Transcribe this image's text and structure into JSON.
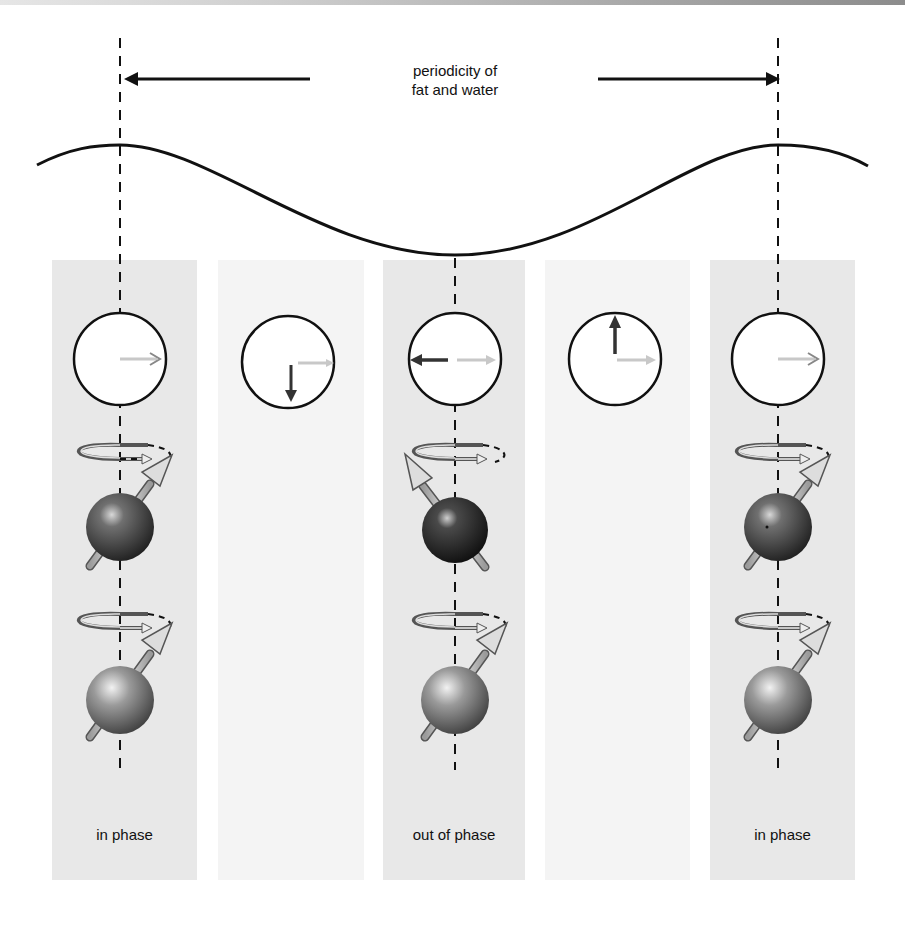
{
  "figure": {
    "title_line1": "periodicity of",
    "title_line2": "fat and water",
    "columns": [
      {
        "index": 0,
        "shade": "dark",
        "phase_label": "in phase",
        "fat_vector_direction": "right",
        "water_vector_direction": "right",
        "spins": true
      },
      {
        "index": 1,
        "shade": "light",
        "phase_label": "",
        "fat_vector_direction": "down",
        "water_vector_direction": "right",
        "spins": false
      },
      {
        "index": 2,
        "shade": "dark",
        "phase_label": "out of phase",
        "fat_vector_direction": "left",
        "water_vector_direction": "right",
        "spins": true
      },
      {
        "index": 3,
        "shade": "light",
        "phase_label": "",
        "fat_vector_direction": "up",
        "water_vector_direction": "right",
        "spins": false
      },
      {
        "index": 4,
        "shade": "dark",
        "phase_label": "in phase",
        "fat_vector_direction": "right",
        "water_vector_direction": "right",
        "spins": true
      }
    ],
    "labels": {
      "col0": "in phase",
      "col2": "out of phase",
      "col4": "in phase"
    },
    "colors": {
      "dark_panel": "#e8e8e8",
      "light_panel": "#f4f4f4",
      "line": "#111111",
      "water_vector": "#c8c8c8",
      "fat_vector": "#333333"
    }
  }
}
